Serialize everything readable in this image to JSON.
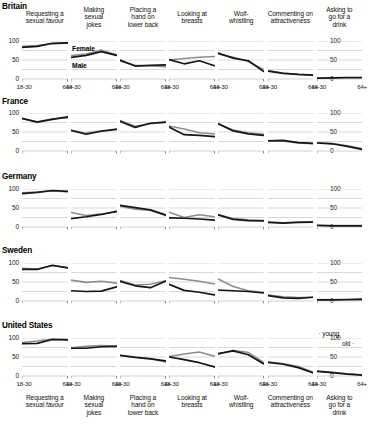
{
  "chart_data": {
    "type": "line",
    "title": "",
    "xlabel": "",
    "ylabel": "",
    "ylim": [
      0,
      100
    ],
    "x": [
      "18-30",
      "31-44",
      "45-64",
      "64+"
    ],
    "x_tick_labels": [
      "18-30",
      "64+"
    ],
    "y_tick_labels": [
      "0",
      "50",
      "100"
    ],
    "y_ticks": [
      0,
      50,
      100
    ],
    "gridlines": [
      0,
      25,
      50,
      75,
      100
    ],
    "legend": {
      "series_labels": [
        "Female",
        "Male"
      ],
      "female_color": "#8d8d8d",
      "male_color": "#161616",
      "age_labels": [
        "young",
        "old"
      ],
      "age_note_position": "united-states-row-last-panel"
    },
    "columns": [
      "Requesting a sexual favour",
      "Making sexual jokes",
      "Placing a hand on lower back",
      "Looking at breasts",
      "Wolf-whistling",
      "Commenting on attractiveness",
      "Asking to go for a drink"
    ],
    "rows": [
      "Britain",
      "France",
      "Germany",
      "Sweden",
      "United States"
    ],
    "panels": [
      {
        "country": "Britain",
        "series": [
          {
            "name": "Female",
            "values": [
              [
                86,
                88,
                93,
                94
              ],
              [
                62,
                66,
                76,
                64
              ],
              [
                47,
                36,
                35,
                32
              ],
              [
                50,
                54,
                57,
                59
              ],
              [
                66,
                57,
                46,
                25
              ],
              [
                22,
                16,
                12,
                11
              ],
              [
                3,
                3,
                3,
                3
              ]
            ]
          },
          {
            "name": "Male",
            "values": [
              [
                83,
                86,
                94,
                95
              ],
              [
                57,
                62,
                72,
                62
              ],
              [
                50,
                34,
                36,
                37
              ],
              [
                51,
                40,
                48,
                35
              ],
              [
                68,
                55,
                48,
                20
              ],
              [
                21,
                15,
                12,
                10
              ],
              [
                2,
                3,
                4,
                4
              ]
            ]
          }
        ]
      },
      {
        "country": "France",
        "series": [
          {
            "name": "Female",
            "values": [
              [
                85,
                77,
                85,
                87
              ],
              [
                55,
                47,
                53,
                58
              ],
              [
                80,
                65,
                72,
                75
              ],
              [
                66,
                58,
                48,
                45
              ],
              [
                71,
                55,
                48,
                44
              ],
              [
                26,
                26,
                21,
                19
              ],
              [
                22,
                20,
                14,
                6
              ]
            ]
          },
          {
            "name": "Male",
            "values": [
              [
                86,
                76,
                83,
                90
              ],
              [
                54,
                44,
                52,
                57
              ],
              [
                78,
                62,
                73,
                76
              ],
              [
                63,
                43,
                41,
                38
              ],
              [
                72,
                53,
                45,
                41
              ],
              [
                27,
                28,
                22,
                20
              ],
              [
                21,
                19,
                12,
                4
              ]
            ]
          }
        ]
      },
      {
        "country": "Germany",
        "series": [
          {
            "name": "Female",
            "values": [
              [
                90,
                92,
                95,
                93
              ],
              [
                38,
                30,
                34,
                40
              ],
              [
                55,
                47,
                44,
                30
              ],
              [
                39,
                25,
                32,
                27
              ],
              [
                33,
                22,
                19,
                17
              ],
              [
                13,
                11,
                13,
                14
              ],
              [
                5,
                4,
                4,
                4
              ]
            ]
          },
          {
            "name": "Male",
            "values": [
              [
                88,
                91,
                96,
                94
              ],
              [
                22,
                27,
                33,
                41
              ],
              [
                57,
                51,
                45,
                32
              ],
              [
                24,
                23,
                21,
                18
              ],
              [
                32,
                20,
                17,
                16
              ],
              [
                12,
                10,
                12,
                13
              ],
              [
                4,
                3,
                3,
                3
              ]
            ]
          }
        ]
      },
      {
        "country": "Sweden",
        "series": [
          {
            "name": "Female",
            "values": [
              [
                86,
                84,
                93,
                88
              ],
              [
                55,
                49,
                52,
                47
              ],
              [
                54,
                42,
                44,
                53
              ],
              [
                62,
                57,
                52,
                45
              ],
              [
                58,
                38,
                27,
                23
              ],
              [
                16,
                11,
                9,
                10
              ],
              [
                4,
                3,
                3,
                3
              ]
            ]
          },
          {
            "name": "Male",
            "values": [
              [
                83,
                83,
                94,
                87
              ],
              [
                27,
                25,
                26,
                37
              ],
              [
                52,
                40,
                35,
                52
              ],
              [
                44,
                28,
                23,
                16
              ],
              [
                29,
                27,
                25,
                21
              ],
              [
                14,
                8,
                7,
                10
              ],
              [
                3,
                3,
                4,
                5
              ]
            ]
          }
        ]
      },
      {
        "country": "United States",
        "series": [
          {
            "name": "Female",
            "values": [
              [
                88,
                92,
                97,
                96
              ],
              [
                74,
                78,
                80,
                79
              ],
              [
                55,
                50,
                46,
                37
              ],
              [
                51,
                58,
                63,
                52
              ],
              [
                57,
                68,
                62,
                36
              ],
              [
                37,
                33,
                25,
                10
              ],
              [
                13,
                10,
                6,
                3
              ]
            ]
          },
          {
            "name": "Male",
            "values": [
              [
                85,
                86,
                96,
                95
              ],
              [
                73,
                73,
                77,
                78
              ],
              [
                54,
                49,
                45,
                40
              ],
              [
                50,
                43,
                35,
                24
              ],
              [
                59,
                66,
                56,
                32
              ],
              [
                36,
                31,
                22,
                8
              ],
              [
                12,
                9,
                5,
                2
              ]
            ]
          }
        ]
      }
    ]
  },
  "headers": {
    "col_labels": [
      "Requesting a\nsexual favour",
      "Making\nsexual\njokes",
      "Placing a\nhand on\nlower back",
      "Looking at\nbreasts",
      "Wolf-\nwhistling",
      "Commenting on\nattractiveness",
      "Asking to\ngo for a\ndrink"
    ]
  },
  "footers": {
    "col_labels": [
      "Requesting a\nsexual favour",
      "Making\nsexual\njokes",
      "Placing a\nhand on\nlower back",
      "Looking at\nbreasts",
      "Wolf-\nwhistling",
      "Commenting on\nattractiveness",
      "Asking to\ngo for a\ndrink"
    ]
  }
}
